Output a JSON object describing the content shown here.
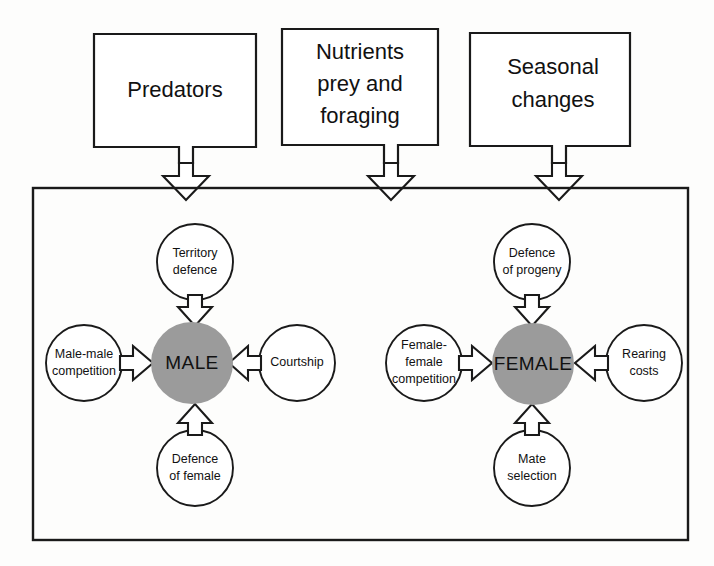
{
  "figure": {
    "type": "conceptual-flow-diagram",
    "background_color": "#fdfdfc",
    "line_color": "#1a1a1a",
    "core_fill_color": "#9b9b9b",
    "satellite_fill_color": "#ffffff"
  },
  "external_factors": {
    "boxes": [
      {
        "id": "predators",
        "label": "Predators",
        "lines": [
          "Predators"
        ]
      },
      {
        "id": "nutrients",
        "label": "Nutrients prey and foraging",
        "lines": [
          "Nutrients",
          "prey and",
          "foraging"
        ]
      },
      {
        "id": "seasonal",
        "label": "Seasonal changes",
        "lines": [
          "Seasonal",
          "changes"
        ]
      }
    ]
  },
  "clusters": [
    {
      "id": "male-cluster",
      "core": {
        "id": "male-core",
        "label": "MALE"
      },
      "satellites": [
        {
          "id": "territory-defence",
          "position": "top",
          "lines": [
            "Territory",
            "defence"
          ]
        },
        {
          "id": "male-male-competition",
          "position": "left",
          "lines": [
            "Male-male",
            "competition"
          ]
        },
        {
          "id": "courtship",
          "position": "right",
          "lines": [
            "Courtship"
          ]
        },
        {
          "id": "defence-of-female",
          "position": "bottom",
          "lines": [
            "Defence",
            "of female"
          ]
        }
      ]
    },
    {
      "id": "female-cluster",
      "core": {
        "id": "female-core",
        "label": "FEMALE"
      },
      "satellites": [
        {
          "id": "defence-of-progeny",
          "position": "top",
          "lines": [
            "Defence",
            "of progeny"
          ]
        },
        {
          "id": "female-female-competition",
          "position": "left",
          "lines": [
            "Female-",
            "female",
            "competition"
          ]
        },
        {
          "id": "rearing-costs",
          "position": "right",
          "lines": [
            "Rearing",
            "costs"
          ]
        },
        {
          "id": "mate-selection",
          "position": "bottom",
          "lines": [
            "Mate",
            "selection"
          ]
        }
      ]
    }
  ]
}
